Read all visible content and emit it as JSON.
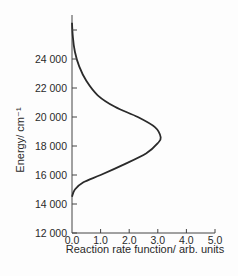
{
  "chart_data": {
    "type": "line",
    "title": "",
    "xlabel": "Reaction rate function/ arb. units",
    "ylabel": "Energy/ cm⁻¹",
    "xlim": [
      0,
      5
    ],
    "ylim": [
      12000,
      26000
    ],
    "grid": false,
    "legend": null,
    "x_ticks": [
      "0.0",
      "1.0",
      "2.0",
      "3.0",
      "4.0",
      "5.0"
    ],
    "y_ticks": [
      "12 000",
      "14 000",
      "16 000",
      "18 000",
      "20 000",
      "22 000",
      "24 000"
    ],
    "series": [
      {
        "name": "reaction rate",
        "points": [
          {
            "x": 0.0,
            "y": 14500
          },
          {
            "x": 0.1,
            "y": 15000
          },
          {
            "x": 0.4,
            "y": 15500
          },
          {
            "x": 1.0,
            "y": 16000
          },
          {
            "x": 1.9,
            "y": 16800
          },
          {
            "x": 2.6,
            "y": 17500
          },
          {
            "x": 3.0,
            "y": 18200
          },
          {
            "x": 3.1,
            "y": 18600
          },
          {
            "x": 2.9,
            "y": 19300
          },
          {
            "x": 2.3,
            "y": 20000
          },
          {
            "x": 1.5,
            "y": 20700
          },
          {
            "x": 0.9,
            "y": 21500
          },
          {
            "x": 0.5,
            "y": 22500
          },
          {
            "x": 0.25,
            "y": 23500
          },
          {
            "x": 0.1,
            "y": 24500
          },
          {
            "x": 0.03,
            "y": 25500
          },
          {
            "x": 0.0,
            "y": 26500
          }
        ]
      }
    ]
  }
}
